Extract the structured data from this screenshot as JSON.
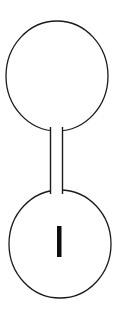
{
  "figure": {
    "canvas": {
      "width": 125,
      "height": 314,
      "background_color": "#ffffff"
    },
    "stroke_color": "#1a1a1a",
    "fill_color": "#ffffff",
    "mark_color": "#0d0d0d",
    "parts": {
      "upper_circle": {
        "label": "upper circle",
        "center_x": 57,
        "center_y": 76,
        "radius_x": 51,
        "radius_y": 55,
        "stroke_width": 1.3
      },
      "neck": {
        "label": "connecting neck",
        "left_x": 50.5,
        "right_x": 62.5,
        "top_y": 128,
        "bottom_y": 193,
        "stroke_width": 1.3
      },
      "lower_circle": {
        "label": "lower circle",
        "center_x": 60,
        "center_y": 244,
        "radius_x": 51,
        "radius_y": 54,
        "stroke_width": 1.3
      },
      "interior_mark": {
        "label": "vertical tick mark",
        "x": 57,
        "y": 226,
        "width": 4.5,
        "height": 31
      }
    }
  }
}
